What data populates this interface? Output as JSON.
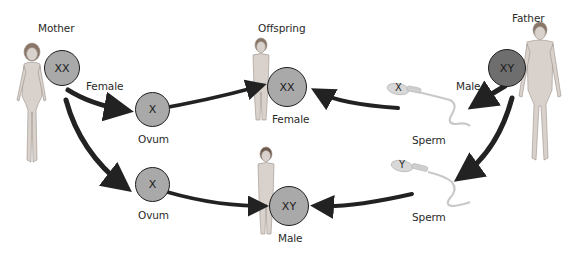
{
  "diagram": {
    "type": "sex-determination-inheritance",
    "colors": {
      "cell_light": "#a9a9a9",
      "cell_dark": "#6e6e6e",
      "arrow": "#222222",
      "skin": "#d9d2cc",
      "sperm": "#d8d8d8"
    },
    "parents": {
      "mother": {
        "label": "Mother",
        "chromosomes": "XX"
      },
      "father": {
        "label": "Father",
        "chromosomes": "XY"
      }
    },
    "gametes": {
      "ovum_top": {
        "chromosome": "X",
        "label": "Ovum"
      },
      "ovum_bottom": {
        "chromosome": "X",
        "label": "Ovum"
      },
      "sperm_top": {
        "chromosome": "X",
        "label": "Sperm"
      },
      "sperm_bottom": {
        "chromosome": "Y",
        "label": "Sperm"
      }
    },
    "arrow_labels": {
      "female": "Female",
      "male": "Male"
    },
    "offspring": {
      "heading": "Offspring",
      "female": {
        "chromosomes": "XX",
        "label": "Female"
      },
      "male": {
        "chromosomes": "XY",
        "label": "Male"
      }
    }
  }
}
